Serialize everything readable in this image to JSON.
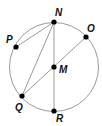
{
  "diagram": {
    "circle": {
      "center": "M",
      "cx": 54,
      "cy": 67,
      "r": 44.5,
      "stroke": "#9a9a9a"
    },
    "points": [
      {
        "id": "N",
        "label": "N",
        "x": 54,
        "y": 22,
        "lx": 55,
        "ly": 16
      },
      {
        "id": "O",
        "label": "O",
        "x": 86,
        "y": 37,
        "lx": 87,
        "ly": 32
      },
      {
        "id": "P",
        "label": "P",
        "x": 16,
        "y": 47,
        "lx": 6,
        "ly": 43
      },
      {
        "id": "M",
        "label": "M",
        "x": 54,
        "y": 67,
        "lx": 59,
        "ly": 73
      },
      {
        "id": "Q",
        "label": "Q",
        "x": 22,
        "y": 96,
        "lx": 15,
        "ly": 111
      },
      {
        "id": "R",
        "label": "R",
        "x": 54,
        "y": 111,
        "lx": 56,
        "ly": 122
      }
    ],
    "segments": [
      {
        "from": "N",
        "to": "P"
      },
      {
        "from": "N",
        "to": "Q"
      },
      {
        "from": "N",
        "to": "R"
      },
      {
        "from": "Q",
        "to": "O"
      }
    ],
    "colors": {
      "line": "#9a9a9a",
      "point": "#000000",
      "label": "#111111"
    }
  }
}
